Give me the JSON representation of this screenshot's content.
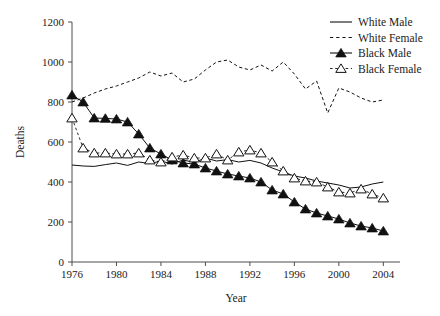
{
  "chart_data": {
    "type": "line",
    "title": "",
    "xlabel": "Year",
    "ylabel": "Deaths",
    "xlim": [
      1976,
      2005.5
    ],
    "ylim": [
      0,
      1200
    ],
    "xticks": [
      1976,
      1980,
      1984,
      1988,
      1992,
      1996,
      2000,
      2004
    ],
    "xticklabels": [
      "1976",
      "1980",
      "1984",
      "1988",
      "1992",
      "1996",
      "2000",
      "2004"
    ],
    "yticks": [
      0,
      200,
      400,
      600,
      800,
      1000,
      1200
    ],
    "yticklabels": [
      "0",
      "200",
      "400",
      "600",
      "800",
      "1000",
      "1200"
    ],
    "grid": false,
    "legend_position": "top-right",
    "x": [
      1976,
      1977,
      1978,
      1979,
      1980,
      1981,
      1982,
      1983,
      1984,
      1985,
      1986,
      1987,
      1988,
      1989,
      1990,
      1991,
      1992,
      1993,
      1994,
      1995,
      1996,
      1997,
      1998,
      1999,
      2000,
      2001,
      2002,
      2003,
      2004
    ],
    "series": [
      {
        "name": "White Male",
        "style": "solid-line",
        "marker": "none",
        "color": "#111111",
        "values": [
          485,
          480,
          478,
          487,
          495,
          483,
          500,
          492,
          505,
          490,
          510,
          498,
          520,
          505,
          512,
          500,
          508,
          495,
          470,
          450,
          430,
          420,
          405,
          395,
          385,
          370,
          375,
          390,
          400
        ]
      },
      {
        "name": "White Female",
        "style": "dashed-line",
        "marker": "none",
        "color": "#111111",
        "values": [
          800,
          820,
          845,
          865,
          880,
          900,
          920,
          950,
          930,
          945,
          900,
          915,
          960,
          1000,
          1010,
          975,
          960,
          985,
          955,
          1000,
          940,
          865,
          905,
          745,
          870,
          850,
          820,
          800,
          810
        ]
      },
      {
        "name": "Black Male",
        "style": "solid-line-marker",
        "marker": "filled-triangle",
        "color": "#111111",
        "values": [
          835,
          800,
          720,
          718,
          715,
          700,
          640,
          570,
          540,
          510,
          495,
          490,
          470,
          455,
          440,
          430,
          420,
          400,
          360,
          340,
          300,
          265,
          245,
          230,
          215,
          195,
          180,
          170,
          155
        ]
      },
      {
        "name": "Black Female",
        "style": "dashed-line-marker",
        "marker": "open-triangle",
        "color": "#111111",
        "values": [
          720,
          570,
          545,
          545,
          540,
          540,
          545,
          510,
          500,
          525,
          535,
          520,
          520,
          540,
          510,
          550,
          560,
          545,
          500,
          455,
          420,
          405,
          400,
          375,
          350,
          345,
          365,
          340,
          320
        ]
      }
    ]
  },
  "legend": {
    "items": [
      {
        "label": "White Male",
        "marker": "solid-line"
      },
      {
        "label": "White Female",
        "marker": "dashed-line"
      },
      {
        "label": "Black Male",
        "marker": "filled-triangle"
      },
      {
        "label": "Black Female",
        "marker": "open-triangle"
      }
    ]
  }
}
